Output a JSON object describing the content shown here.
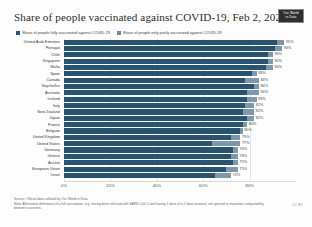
{
  "header": {
    "title": "Share of people vaccinated against COVID-19, Feb 2, 2022",
    "logo_line1": "Our World",
    "logo_line2": "in Data"
  },
  "legend": {
    "items": [
      {
        "label": "Share of people fully vaccinated against COVID-19",
        "color": "#29536f"
      },
      {
        "label": "Share of people only partly vaccinated against COVID-19",
        "color": "#7d97ac"
      }
    ]
  },
  "footer": {
    "source": "Source: Official data collated by Our World in Data",
    "note": "Note: Alternative definitions of a full vaccination, e.g. having been infected with SARS-CoV-2 and having 1 dose of a 2-dose protocol, are ignored to maximize comparability between countries.",
    "license": "CC BY"
  },
  "chart_data": {
    "type": "bar",
    "title": "Share of people vaccinated against COVID-19, Feb 2, 2022",
    "xlabel": "",
    "ylabel": "",
    "orientation": "horizontal",
    "grid": true,
    "legend_position": "top",
    "xlim": [
      0,
      100
    ],
    "xticks": [
      "0%",
      "20%",
      "40%",
      "60%",
      "80%"
    ],
    "xtick_values": [
      0,
      20,
      40,
      60,
      80
    ],
    "categories": [
      "United Arab Emirates",
      "Portugal",
      "Chile",
      "Singapore",
      "Malta",
      "Spain",
      "Canada",
      "Seychelles",
      "Australia",
      "Iceland",
      "Italy",
      "New Zealand",
      "Japan",
      "France",
      "Belgium",
      "United Kingdom",
      "United States",
      "Germany",
      "Greece",
      "Austria",
      "European Union",
      "Israel"
    ],
    "series": [
      {
        "name": "Share of people fully vaccinated against COVID-19",
        "values": [
          92,
          91,
          88,
          88,
          87,
          81,
          78,
          82,
          79,
          79,
          78,
          77,
          79,
          77,
          76,
          72,
          64,
          73,
          72,
          73,
          70,
          65
        ]
      },
      {
        "name": "Share of people only partly vaccinated against COVID-19",
        "values": [
          3,
          3,
          2,
          2,
          3,
          2,
          6,
          2,
          5,
          4,
          4,
          5,
          3,
          2,
          1,
          4,
          12,
          2,
          3,
          2,
          5,
          7
        ]
      }
    ],
    "labels": [
      "95%",
      "94%",
      "90%",
      "90%",
      "90%",
      "83%",
      "84%",
      "84%",
      "84%",
      "83%",
      "82%",
      "82%",
      "82%",
      "80%",
      "80%",
      "79%",
      "77%",
      "76%",
      "76%",
      "75%",
      "75%",
      "72%"
    ]
  }
}
